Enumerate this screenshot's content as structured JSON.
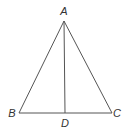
{
  "diagram": {
    "type": "triangle-with-altitude",
    "stroke_color": "#555555",
    "label_color": "#333333",
    "vertices": {
      "A": {
        "label": "A",
        "x": 64,
        "y": 21,
        "label_x": 64,
        "label_y": 15
      },
      "B": {
        "label": "B",
        "x": 19,
        "y": 113,
        "label_x": 12,
        "label_y": 117
      },
      "C": {
        "label": "C",
        "x": 112,
        "y": 113,
        "label_x": 117,
        "label_y": 117
      },
      "D": {
        "label": "D",
        "x": 65,
        "y": 113,
        "label_x": 65,
        "label_y": 127
      }
    },
    "segments": [
      {
        "from": "A",
        "to": "B"
      },
      {
        "from": "A",
        "to": "C"
      },
      {
        "from": "B",
        "to": "C"
      },
      {
        "from": "A",
        "to": "D"
      }
    ]
  }
}
